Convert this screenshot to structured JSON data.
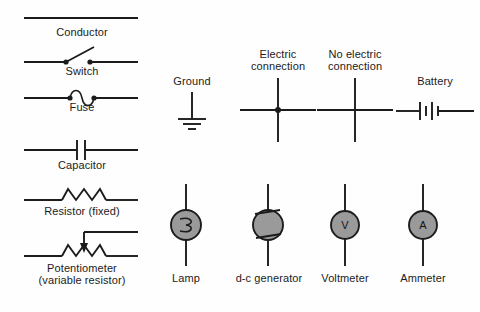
{
  "figure": {
    "background_color": "#fefefe",
    "line_color": "#1c1c1c",
    "fill_color": "#9a9a9a",
    "text_color": "#1b1b1b"
  },
  "symbols": {
    "conductor": {
      "label": "Conductor",
      "type": "straight-line"
    },
    "switch": {
      "label": "Switch",
      "type": "single-pole-switch"
    },
    "fuse": {
      "label": "Fuse",
      "type": "s-curve-fuse"
    },
    "capacitor": {
      "label": "Capacitor",
      "type": "parallel-plates"
    },
    "resistor": {
      "label": "Resistor (fixed)",
      "type": "zigzag"
    },
    "potentiometer": {
      "label_line1": "Potentiometer",
      "label_line2": "(variable resistor)",
      "type": "zigzag-with-wiper-arrow"
    },
    "ground": {
      "label": "Ground",
      "type": "earth-ground-bars",
      "bars": 3
    },
    "electric_connection": {
      "label_line1": "Electric",
      "label_line2": "connection",
      "type": "crossing-wires-with-junction-dot"
    },
    "no_electric_connection": {
      "label_line1": "No electric",
      "label_line2": "connection",
      "type": "crossing-wires-no-dot"
    },
    "battery": {
      "label": "Battery",
      "type": "battery-cells",
      "cells": 2
    },
    "lamp": {
      "label": "Lamp",
      "type": "filament-circle"
    },
    "dc_generator": {
      "label": "d-c generator",
      "type": "generator-circle-with-brushes"
    },
    "voltmeter": {
      "label": "Voltmeter",
      "type": "meter-circle",
      "glyph": "V"
    },
    "ammeter": {
      "label": "Ammeter",
      "type": "meter-circle",
      "glyph": "A"
    }
  }
}
